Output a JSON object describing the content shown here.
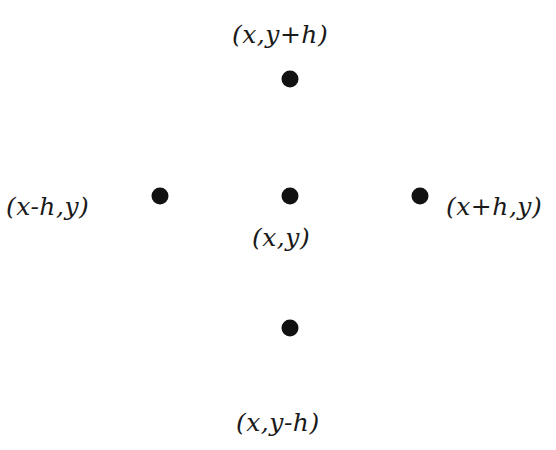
{
  "diagram": {
    "type": "five-point-stencil",
    "points": [
      {
        "id": "top",
        "label": "(x,y+h)"
      },
      {
        "id": "left",
        "label": "(x-h,y)"
      },
      {
        "id": "center",
        "label": "(x,y)"
      },
      {
        "id": "right",
        "label": "(x+h,y)"
      },
      {
        "id": "bottom",
        "label": "(x,y-h)"
      }
    ],
    "colors": {
      "dot": "#111111",
      "text": "#1a1a1a",
      "background": "#ffffff"
    }
  }
}
